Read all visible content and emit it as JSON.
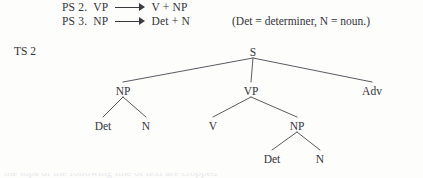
{
  "page": {
    "background_color": "#fdfdfc",
    "ink_color": "#33343a"
  },
  "rules": {
    "line1": {
      "label": "PS 2.",
      "lhs": "VP",
      "arrow": "long-rightwards-arrow",
      "rhs": "V + NP"
    },
    "line2": {
      "label": "PS 3.",
      "lhs": "NP",
      "arrow": "long-rightwards-arrow",
      "rhs": "Det + N"
    },
    "note": "(Det = determiner, N = noun.)"
  },
  "ts": {
    "label": "TS 2"
  },
  "tree": {
    "nodes": [
      {
        "id": "s",
        "label": "S",
        "x": 253,
        "y": 53
      },
      {
        "id": "np1",
        "label": "NP",
        "x": 123,
        "y": 92
      },
      {
        "id": "vp",
        "label": "VP",
        "x": 251,
        "y": 92
      },
      {
        "id": "adv",
        "label": "Adv",
        "x": 372,
        "y": 92
      },
      {
        "id": "det1",
        "label": "Det",
        "x": 103,
        "y": 127
      },
      {
        "id": "n1",
        "label": "N",
        "x": 146,
        "y": 127
      },
      {
        "id": "v",
        "label": "V",
        "x": 213,
        "y": 127
      },
      {
        "id": "np2",
        "label": "NP",
        "x": 297,
        "y": 127
      },
      {
        "id": "det2",
        "label": "Det",
        "x": 272,
        "y": 160
      },
      {
        "id": "n2",
        "label": "N",
        "x": 320,
        "y": 160
      }
    ],
    "edges": [
      {
        "from": "s",
        "to": "np1"
      },
      {
        "from": "s",
        "to": "vp"
      },
      {
        "from": "s",
        "to": "adv"
      },
      {
        "from": "np1",
        "to": "det1"
      },
      {
        "from": "np1",
        "to": "n1"
      },
      {
        "from": "vp",
        "to": "v"
      },
      {
        "from": "vp",
        "to": "np2"
      },
      {
        "from": "np2",
        "to": "det2"
      },
      {
        "from": "np2",
        "to": "n2"
      }
    ],
    "line_color": "#5a5b62"
  },
  "bottom_crop": {
    "text": "the tops of the following line of text are cropped"
  }
}
